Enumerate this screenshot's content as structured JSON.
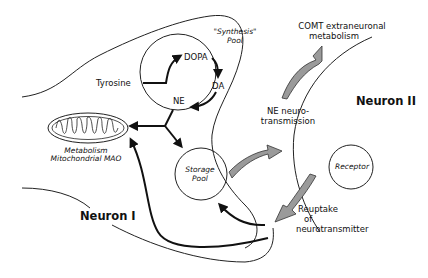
{
  "synthesis_pool": {
    "label_line1": "\"Synthesis\"",
    "label_line2": "Pool",
    "pathway": [
      "Tyrosine",
      "DOPA",
      "DA",
      "NE"
    ]
  },
  "mitochondrion": {
    "label_line1": "Metabolism",
    "label_line2": "Mitochondrial MAO"
  },
  "storage_pool": {
    "label_line1": "Storage",
    "label_line2": "Pool"
  },
  "receptor": {
    "label": "Receptor"
  },
  "neurons": {
    "presynaptic": "Neuron I",
    "postsynaptic": "Neuron II"
  },
  "processes": {
    "comt_line1": "COMT extraneuronal",
    "comt_line2": "metabolism",
    "transmission_line1": "NE neuro-",
    "transmission_line2": "transmission",
    "reuptake_line1": "Reuptake",
    "reuptake_line2": "of",
    "reuptake_line3": "neurotransmitter"
  },
  "colors": {
    "line": "#111111",
    "flow_arrow_fill": "#9a9a9a",
    "background": "#ffffff"
  }
}
